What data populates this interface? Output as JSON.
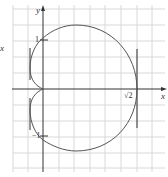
{
  "figure": {
    "outer_label": "x",
    "axis_x_label": "x",
    "axis_y_label": "y",
    "tick_1": "1",
    "tick_neg1": "−1",
    "tick_sqrt2": "√2",
    "colors": {
      "grid": "#d8d8d8",
      "axis": "#333333",
      "curve": "#555555"
    }
  }
}
